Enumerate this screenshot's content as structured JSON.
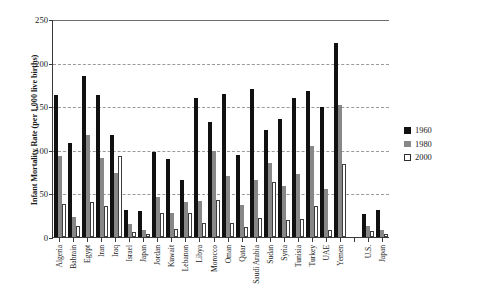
{
  "chart_data": {
    "type": "bar",
    "title": "",
    "xlabel": "",
    "ylabel": "Infant Mortality Rate (per 1,000 live births)",
    "ylim": [
      0,
      250
    ],
    "yticks": [
      0,
      50,
      100,
      150,
      200,
      250
    ],
    "ytick_labels": [
      "0",
      "50",
      "100",
      "150",
      "200",
      "250"
    ],
    "grid": true,
    "grid_axis": "y",
    "legend_position": "right",
    "categories": [
      "Algeria",
      "Bahrain",
      "Egypt",
      "Iran",
      "Iraq",
      "Israel",
      "Japan",
      "Jordan",
      "Kuwait",
      "Lebanon",
      "Libya",
      "Morocco",
      "Oman",
      "Qatar",
      "Saudi Arabia",
      "Sudan",
      "Syria",
      "Tunisia",
      "Turkey",
      "UAE",
      "Yemen",
      "",
      "U.S.",
      "Japan"
    ],
    "series": [
      {
        "name": "1960",
        "color": "#111111",
        "values": [
          163,
          108,
          185,
          163,
          117,
          31,
          30,
          97,
          89,
          65,
          159,
          132,
          164,
          94,
          170,
          123,
          135,
          159,
          168,
          149,
          223,
          null,
          26,
          31
        ]
      },
      {
        "name": "1980",
        "color": "#878787",
        "values": [
          93,
          23,
          117,
          91,
          73,
          15,
          8,
          46,
          27,
          40,
          41,
          99,
          70,
          37,
          65,
          85,
          58,
          72,
          104,
          55,
          151,
          null,
          13,
          8
        ]
      },
      {
        "name": "2000",
        "color": "#ffffff",
        "values": [
          38,
          13,
          40,
          36,
          93,
          6,
          3,
          27,
          9,
          27,
          16,
          42,
          16,
          12,
          22,
          63,
          20,
          21,
          36,
          8,
          84,
          null,
          7,
          3
        ]
      }
    ]
  },
  "legend": {
    "items": [
      {
        "label": "1960",
        "swatch": "y1960"
      },
      {
        "label": "1980",
        "swatch": "y1980"
      },
      {
        "label": "2000",
        "swatch": "y2000"
      }
    ]
  }
}
